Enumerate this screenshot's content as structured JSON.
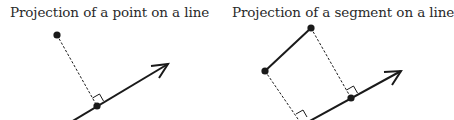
{
  "panels": [
    {
      "title": "Projection of a point on a line",
      "line": {
        "x1": 66,
        "y1": 125,
        "x2": 168,
        "y2": 64
      },
      "arrow_head": {
        "tip": [
          168,
          64
        ],
        "wing1": [
          151,
          66
        ],
        "wing2": [
          159,
          78
        ]
      },
      "points": [
        {
          "name": "point",
          "x": 57,
          "y": 35
        },
        {
          "name": "projection",
          "x": 97,
          "y": 106
        }
      ],
      "dashed": [
        {
          "x1": 57,
          "y1": 35,
          "x2": 97,
          "y2": 106
        }
      ],
      "right_angles": [
        {
          "path": "M 92.5 98 L 99.5 94 L 103.5 101"
        }
      ]
    },
    {
      "title": "Projection of a segment on a line",
      "line": {
        "x1": 297,
        "y1": 128,
        "x2": 401,
        "y2": 71
      },
      "arrow_head": {
        "tip": [
          401,
          71
        ],
        "wing1": [
          384,
          72
        ],
        "wing2": [
          392,
          85
        ]
      },
      "segment": {
        "x1": 265,
        "y1": 71,
        "x2": 311,
        "y2": 28
      },
      "points": [
        {
          "name": "segment-end-a",
          "x": 265,
          "y": 71
        },
        {
          "name": "segment-end-b",
          "x": 311,
          "y": 28
        },
        {
          "name": "projection-b",
          "x": 351,
          "y": 98
        }
      ],
      "dashed": [
        {
          "x1": 265,
          "y1": 71,
          "x2": 300,
          "y2": 122
        },
        {
          "x1": 311,
          "y1": 28,
          "x2": 351,
          "y2": 98
        }
      ],
      "right_angles": [
        {
          "path": "M 346.5 90 L 353.5 86 L 357.5 93"
        },
        {
          "path": "M 296 114 L 303 110 L 307 117"
        }
      ]
    }
  ],
  "colors": {
    "stroke": "#1a1a1a",
    "title": "#2a2a2a",
    "background": "#ffffff"
  }
}
